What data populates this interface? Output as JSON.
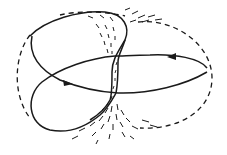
{
  "diagram": {
    "colors": {
      "background": "#ffffff",
      "stroke": "#1a1a1a"
    },
    "elements": [
      {
        "id": "outer-boundary",
        "style": "dashed",
        "shape": "ellipse"
      },
      {
        "id": "figure-eight-loop",
        "style": "solid",
        "shape": "closed curve"
      },
      {
        "id": "arrow-right-lobe",
        "direction": "leftward"
      },
      {
        "id": "arrow-left-lobe",
        "direction": "rightward"
      },
      {
        "id": "central-hatched-band",
        "style": "stippled"
      },
      {
        "id": "upper-field-lines",
        "style": "dashed strokes"
      },
      {
        "id": "lower-field-lines",
        "style": "dashed strokes"
      }
    ]
  }
}
